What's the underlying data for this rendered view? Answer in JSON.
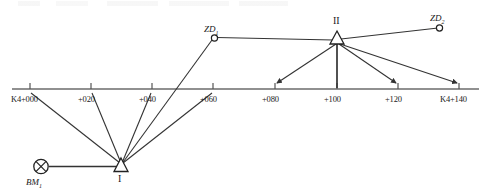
{
  "figure": {
    "kind": "leveling-traverse-diagram",
    "width": 487,
    "height": 195,
    "line_color": "#333333",
    "axis_color": "#666666",
    "text_color": "#1a1a1a"
  },
  "axis": {
    "name": "chainage-axis",
    "y": 89,
    "x_start": 12,
    "x_end": 479,
    "ticks": [
      {
        "label": "K4+000",
        "x": 30
      },
      {
        "label": "+020",
        "x": 91
      },
      {
        "label": "+040",
        "x": 152
      },
      {
        "label": "+060",
        "x": 213
      },
      {
        "label": "+080",
        "x": 275
      },
      {
        "label": "+100",
        "x": 337
      },
      {
        "label": "+120",
        "x": 398
      },
      {
        "label": "K4+140",
        "x": 459
      }
    ]
  },
  "points": {
    "benchmark": {
      "label": "BM",
      "sub": "1",
      "x": 40,
      "y": 167,
      "marker": "crossed-circle"
    },
    "station_1": {
      "label": "I",
      "x": 121,
      "y": 167,
      "marker": "triangle"
    },
    "station_2": {
      "label": "II",
      "x": 337,
      "y": 39,
      "marker": "triangle"
    },
    "turning_point_1": {
      "label": "ZD",
      "sub": "1",
      "x": 214,
      "y": 38,
      "marker": "circle"
    },
    "turning_point_2": {
      "label": "ZD",
      "sub": "2",
      "x": 440,
      "y": 27,
      "marker": "circle"
    }
  },
  "sights": {
    "from_station_1": [
      {
        "to": "K4+000",
        "x": 30,
        "y": 89,
        "arrow": false
      },
      {
        "to": "+020",
        "x": 91,
        "y": 89,
        "arrow": false
      },
      {
        "to": "+040",
        "x": 152,
        "y": 89,
        "arrow": false
      },
      {
        "to": "+060",
        "x": 213,
        "y": 89,
        "arrow": false
      },
      {
        "to": "ZD1",
        "x": 214,
        "y": 38,
        "arrow": false
      }
    ],
    "from_station_2": [
      {
        "to": "+080",
        "x": 275,
        "y": 89,
        "arrow": true
      },
      {
        "to": "+100",
        "x": 337,
        "y": 89,
        "arrow": false
      },
      {
        "to": "+120",
        "x": 398,
        "y": 89,
        "arrow": true
      },
      {
        "to": "K4+140",
        "x": 459,
        "y": 89,
        "arrow": true
      },
      {
        "to": "ZD1",
        "x": 214,
        "y": 38,
        "arrow": false
      },
      {
        "to": "ZD2",
        "x": 440,
        "y": 27,
        "arrow": false
      }
    ],
    "benchmark_to_station_1": {
      "from_x": 48,
      "to_x": 118,
      "y": 167
    }
  },
  "labels": {
    "axis_ticks": [
      "K4+000",
      "+020",
      "+040",
      "+060",
      "+080",
      "+100",
      "+120",
      "K4+140"
    ],
    "bm": "BM",
    "bm_sub": "1",
    "stn1": "I",
    "stn2": "II",
    "zd1": "ZD",
    "zd1_sub": "1",
    "zd2": "ZD",
    "zd2_sub": "2"
  }
}
